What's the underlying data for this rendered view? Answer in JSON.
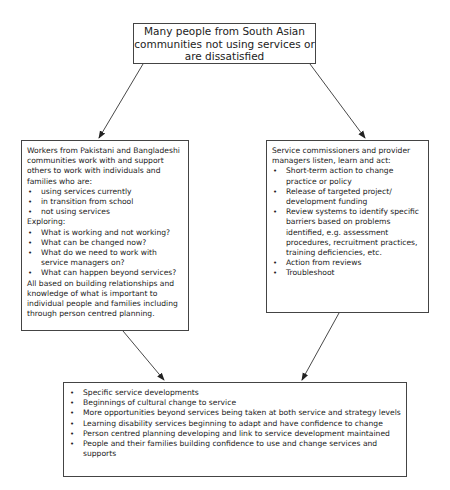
{
  "top_box": {
    "text": "Many people from South Asian communities not using services or are dissatisfied"
  },
  "left_box": {
    "intro": "Workers from Pakistani and Bangladeshi communities work with and support others to work with individuals and families who are:",
    "groups": [
      "using services currently",
      "in transition from school",
      "not using services"
    ],
    "exploring_label": "Exploring:",
    "questions": [
      "What is working and not working?",
      "What can be changed now?",
      "What do we need to work with service managers on?",
      "What can happen beyond services?"
    ],
    "conclusion": "All based on building relationships and knowledge of what is important to individual people and families including through person centred planning."
  },
  "right_box": {
    "intro": "Service commissioners and provider managers listen, learn and act:",
    "actions": [
      "Short-term action to change practice or policy",
      "Release of targeted project/ development funding",
      "Review systems to identify specific barriers based on problems identified, e.g. assessment procedures, recruitment practices, training deficiencies, etc.",
      "Action from reviews",
      "Troubleshoot"
    ]
  },
  "bottom_box": {
    "outcomes": [
      "Specific service developments",
      "Beginnings of cultural change to service",
      "More opportunities beyond services being taken at both service and strategy levels",
      "Learning disability services beginning to adapt and have confidence to change",
      "Person centred planning developing and link to service development maintained",
      "People and their families building confidence to use and change services and supports"
    ]
  },
  "arrows": [
    {
      "from": "top_box",
      "to": "left_box"
    },
    {
      "from": "top_box",
      "to": "right_box"
    },
    {
      "from": "left_box",
      "to": "bottom_box"
    },
    {
      "from": "right_box",
      "to": "bottom_box"
    }
  ]
}
